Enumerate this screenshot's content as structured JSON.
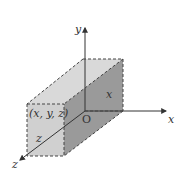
{
  "diagram": {
    "type": "3d-coordinate-box",
    "axes": {
      "x_label": "x",
      "y_label": "y",
      "z_label": "z",
      "origin_label": "O"
    },
    "point_label": "(x, y, z)",
    "edge_labels": {
      "x_edge": "x",
      "z_edge": "z"
    },
    "colors": {
      "top_face": "#d9d9d9",
      "front_face": "#d0d0d0",
      "side_face": "#9a9a9a",
      "dashed_edges": "#444444",
      "axes": "#333333"
    }
  }
}
